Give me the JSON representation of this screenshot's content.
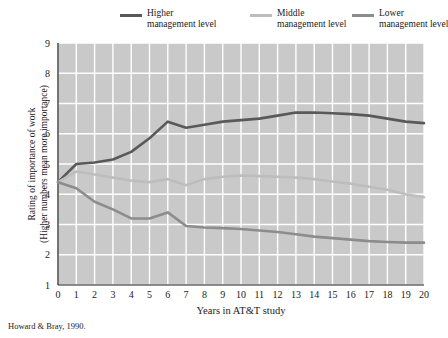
{
  "chart_data": {
    "type": "line",
    "title": "",
    "xlabel": "Years in AT&T study",
    "ylabel_line1": "Rating of importance of work",
    "ylabel_line2": "(Higher numbers mean more importance)",
    "source": "Howard & Bray, 1990.",
    "x": [
      0,
      1,
      2,
      3,
      4,
      5,
      6,
      7,
      8,
      9,
      10,
      11,
      12,
      13,
      14,
      15,
      16,
      17,
      18,
      19,
      20
    ],
    "xlim": [
      0,
      20
    ],
    "ylim": [
      1,
      9
    ],
    "xticks": [
      "0",
      "1",
      "2",
      "3",
      "4",
      "5",
      "6",
      "7",
      "8",
      "9",
      "10",
      "11",
      "12",
      "13",
      "14",
      "15",
      "16",
      "17",
      "18",
      "19",
      "20"
    ],
    "yticks": [
      "1",
      "2",
      "3",
      "4",
      "5",
      "6",
      "7",
      "8",
      "9"
    ],
    "grid": true,
    "legend_position": "top",
    "plot_background": "#c9c9c9",
    "gridline_color": "#ffffff",
    "series": [
      {
        "name": "Higher management level",
        "legend_line1": "Higher",
        "legend_line2": "management level",
        "color": "#595959",
        "values": [
          4.4,
          5.0,
          5.05,
          5.15,
          5.4,
          5.85,
          6.4,
          6.2,
          6.3,
          6.4,
          6.45,
          6.5,
          6.6,
          6.7,
          6.7,
          6.68,
          6.65,
          6.6,
          6.5,
          6.4,
          6.35
        ]
      },
      {
        "name": "Middle management level",
        "legend_line1": "Middle",
        "legend_line2": "management level",
        "color": "#bdbdbd",
        "values": [
          4.4,
          4.75,
          4.65,
          4.55,
          4.45,
          4.4,
          4.5,
          4.3,
          4.5,
          4.58,
          4.62,
          4.6,
          4.58,
          4.55,
          4.5,
          4.42,
          4.35,
          4.25,
          4.15,
          4.0,
          3.9
        ]
      },
      {
        "name": "Lower management level",
        "legend_line1": "Lower",
        "legend_line2": "management level",
        "color": "#8c8c8c",
        "values": [
          4.4,
          4.2,
          3.75,
          3.5,
          3.2,
          3.2,
          3.4,
          2.95,
          2.9,
          2.88,
          2.85,
          2.8,
          2.75,
          2.68,
          2.6,
          2.55,
          2.5,
          2.45,
          2.42,
          2.4,
          2.4
        ]
      }
    ]
  }
}
